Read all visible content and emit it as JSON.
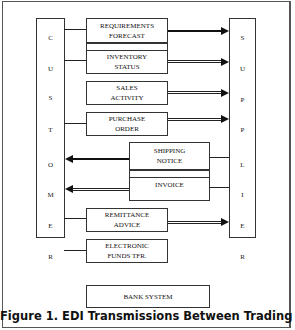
{
  "diagram": {
    "customer": {
      "label": "CUSTOMER",
      "letters": [
        "C",
        "U",
        "S",
        "T",
        "O",
        "M",
        "E",
        "R"
      ]
    },
    "supplier": {
      "label": "SUPPLIER",
      "letters": [
        "S",
        "U",
        "P",
        "P",
        "L",
        "I",
        "E",
        "R"
      ]
    },
    "messages": [
      {
        "line1": "REQUIREMENTS",
        "line2": "FORECAST",
        "direction": "customer-to-supplier"
      },
      {
        "line1": "INVENTORY",
        "line2": "STATUS",
        "direction": "customer-to-supplier"
      },
      {
        "line1": "SALES",
        "line2": "ACTIVITY",
        "direction": "customer-to-supplier"
      },
      {
        "line1": "PURCHASE",
        "line2": "ORDER",
        "direction": "customer-to-supplier"
      },
      {
        "line1": "SHIPPING",
        "line2": "NOTICE",
        "direction": "supplier-to-customer"
      },
      {
        "line1": "INVOICE",
        "line2": "",
        "direction": "supplier-to-customer"
      },
      {
        "line1": "REMITTANCE",
        "line2": "ADVICE",
        "direction": "customer-to-supplier"
      },
      {
        "line1": "ELECTRONIC",
        "line2": "FUNDS TFR.",
        "direction": "customer-to-bank"
      }
    ],
    "bank": {
      "label": "BANK SYSTEM"
    },
    "caption": "Figure 1. EDI Transmissions Between Trading Partners"
  }
}
